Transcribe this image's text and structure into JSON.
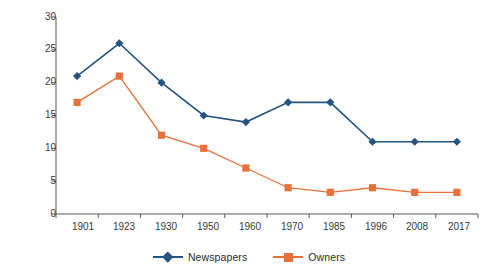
{
  "chart_data": {
    "type": "line",
    "title": "",
    "xlabel": "",
    "ylabel": "No. owners and papers",
    "categories": [
      "1901",
      "1923",
      "1930",
      "1950",
      "1960",
      "1970",
      "1985",
      "1996",
      "2008",
      "2017"
    ],
    "yticks": [
      0,
      5,
      10,
      15,
      20,
      25,
      30
    ],
    "ylim": [
      0,
      30
    ],
    "grid": false,
    "legend_position": "bottom-center",
    "series": [
      {
        "name": "Newspapers",
        "color": "#26537f",
        "marker": "diamond",
        "values": [
          21,
          26,
          20,
          15,
          14,
          17,
          17,
          11,
          11,
          11
        ]
      },
      {
        "name": "Owners",
        "color": "#e8703a",
        "marker": "square",
        "values": [
          17,
          21,
          12,
          10,
          7,
          4,
          3.3,
          4,
          3.3,
          3.3
        ]
      }
    ]
  },
  "axis": {
    "y_title": "No. owners and papers",
    "y_tick_labels": [
      "30",
      "25",
      "20",
      "15",
      "10",
      "5",
      "0"
    ],
    "x_tick_labels": [
      "1901",
      "1923",
      "1930",
      "1950",
      "1960",
      "1970",
      "1985",
      "1996",
      "2008",
      "2017"
    ]
  },
  "legend": {
    "items": [
      {
        "label": "Newspapers",
        "color": "#26537f",
        "marker": "diamond-icon"
      },
      {
        "label": "Owners",
        "color": "#e8703a",
        "marker": "square-icon"
      }
    ]
  },
  "style": {
    "axis_color": "#595959",
    "text_color": "#3a3a3a",
    "background": "#ffffff",
    "series_blue": "#26537f",
    "series_orange": "#e8703a"
  }
}
